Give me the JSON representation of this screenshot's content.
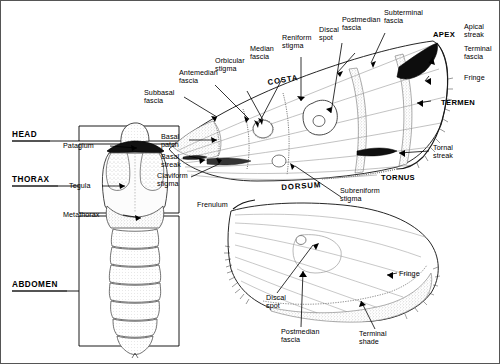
{
  "figure": {
    "background_color": "#ffffff",
    "ink_color": "#000000",
    "wing_wash_color": "#9a9a9a"
  },
  "body_regions": [
    {
      "name": "head",
      "label": "HEAD"
    },
    {
      "name": "thorax",
      "label": "THORAX"
    },
    {
      "name": "abdomen",
      "label": "ABDOMEN"
    }
  ],
  "body_parts": [
    {
      "name": "patagium",
      "label": "Patagium"
    },
    {
      "name": "tegula",
      "label": "Tegula"
    },
    {
      "name": "metathorax",
      "label": "Metathorax"
    }
  ],
  "forewing_margins": [
    {
      "name": "costa",
      "label": "COSTA"
    },
    {
      "name": "dorsum",
      "label": "DORSUM"
    },
    {
      "name": "apex",
      "label": "APEX"
    },
    {
      "name": "termen",
      "label": "TERMEN"
    },
    {
      "name": "tornus",
      "label": "TORNUS"
    }
  ],
  "forewing_labels": [
    {
      "name": "subbasal-fascia",
      "line1": "Subbasal",
      "line2": "fascia"
    },
    {
      "name": "antemedian-fascia",
      "line1": "Antemedian",
      "line2": "fascia"
    },
    {
      "name": "orbicular-stigma",
      "line1": "Orbicular",
      "line2": "stigma"
    },
    {
      "name": "median-fascia",
      "line1": "Median",
      "line2": "fascia"
    },
    {
      "name": "reniform-stigma",
      "line1": "Reniform",
      "line2": "stigma"
    },
    {
      "name": "discal-spot",
      "line1": "Discal",
      "line2": "spot"
    },
    {
      "name": "postmedian-fascia",
      "line1": "Postmedian",
      "line2": "fascia"
    },
    {
      "name": "subterminal-fascia",
      "line1": "Subterminal",
      "line2": "fascia"
    },
    {
      "name": "apical-streak",
      "line1": "Apical",
      "line2": "streak"
    },
    {
      "name": "terminal-fascia",
      "line1": "Terminal",
      "line2": "fascia"
    },
    {
      "name": "fringe-forewing",
      "line1": "Fringe",
      "line2": ""
    },
    {
      "name": "tornal-streak",
      "line1": "Tornal",
      "line2": "streak"
    },
    {
      "name": "subreniform-stigma",
      "line1": "Subreniform",
      "line2": "stigma"
    },
    {
      "name": "claviform-stigma",
      "line1": "Claviform",
      "line2": "stigma"
    },
    {
      "name": "basal-streak",
      "line1": "Basal",
      "line2": "streak"
    },
    {
      "name": "basal-patch",
      "line1": "Basal",
      "line2": "patch"
    }
  ],
  "hindwing_labels": [
    {
      "name": "frenulum",
      "line1": "Frenulum",
      "line2": ""
    },
    {
      "name": "discal-spot-hind",
      "line1": "Discal",
      "line2": "spot"
    },
    {
      "name": "postmedian-fascia-hind",
      "line1": "Postmedian",
      "line2": "fascia"
    },
    {
      "name": "terminal-shade",
      "line1": "Terminal",
      "line2": "shade"
    },
    {
      "name": "fringe-hindwing",
      "line1": "Fringe",
      "line2": ""
    }
  ]
}
